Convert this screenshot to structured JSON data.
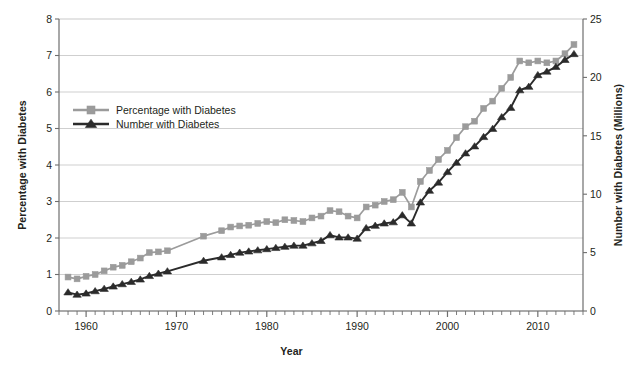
{
  "chart_data": {
    "type": "line",
    "title": "",
    "subtitle": "",
    "xlabel": "Year",
    "ylabel": "Percentage with Diabetes",
    "ylabel_right": "Number with Diabetes (Millions)",
    "grid": true,
    "legend_position": "upper-left-inside",
    "xlim": [
      1957,
      2015
    ],
    "ylim": [
      0,
      8
    ],
    "ylim_right": [
      0,
      25
    ],
    "xticks": [
      1960,
      1970,
      1980,
      1990,
      2000,
      2010
    ],
    "xtick_labels": [
      "1960",
      "1970",
      "1980",
      "1990",
      "2000",
      "2010"
    ],
    "xminor_tick_step": 1,
    "yticks": [
      0,
      1,
      2,
      3,
      4,
      5,
      6,
      7,
      8
    ],
    "ytick_labels": [
      "0",
      "1",
      "2",
      "3",
      "4",
      "5",
      "6",
      "7",
      "8"
    ],
    "yticks_right": [
      0,
      5,
      10,
      15,
      20,
      25
    ],
    "ytick_labels_right": [
      "0",
      "5",
      "10",
      "15",
      "20",
      "25"
    ],
    "x": [
      1958,
      1959,
      1960,
      1961,
      1962,
      1963,
      1964,
      1965,
      1966,
      1967,
      1968,
      1969,
      1973,
      1975,
      1976,
      1977,
      1978,
      1979,
      1980,
      1981,
      1982,
      1983,
      1984,
      1985,
      1986,
      1987,
      1988,
      1989,
      1990,
      1991,
      1992,
      1993,
      1994,
      1995,
      1996,
      1997,
      1998,
      1999,
      2000,
      2001,
      2002,
      2003,
      2004,
      2005,
      2006,
      2007,
      2008,
      2009,
      2010,
      2011,
      2012,
      2013,
      2014
    ],
    "series": [
      {
        "name": "Percentage with Diabetes",
        "axis": "left",
        "color": "#9b9b9b",
        "marker": "square",
        "values": [
          0.93,
          0.88,
          0.95,
          1.0,
          1.1,
          1.2,
          1.25,
          1.35,
          1.45,
          1.6,
          1.62,
          1.65,
          2.05,
          2.2,
          2.3,
          2.33,
          2.35,
          2.4,
          2.45,
          2.42,
          2.5,
          2.48,
          2.45,
          2.55,
          2.6,
          2.75,
          2.72,
          2.6,
          2.55,
          2.85,
          2.9,
          3.0,
          3.05,
          3.25,
          2.85,
          3.55,
          3.85,
          4.15,
          4.4,
          4.75,
          5.05,
          5.2,
          5.55,
          5.75,
          6.1,
          6.4,
          6.85,
          6.8,
          6.85,
          6.8,
          6.85,
          7.05,
          7.3
        ]
      },
      {
        "name": "Number with Diabetes",
        "axis": "right",
        "color": "#2b2b2b",
        "marker": "triangle",
        "values": [
          1.6,
          1.4,
          1.5,
          1.7,
          1.9,
          2.1,
          2.3,
          2.5,
          2.7,
          3.0,
          3.2,
          3.4,
          4.3,
          4.6,
          4.8,
          5.0,
          5.1,
          5.2,
          5.3,
          5.4,
          5.5,
          5.6,
          5.6,
          5.8,
          6.0,
          6.5,
          6.3,
          6.3,
          6.2,
          7.1,
          7.3,
          7.5,
          7.6,
          8.2,
          7.5,
          9.3,
          10.3,
          11.0,
          11.9,
          12.7,
          13.5,
          14.1,
          14.9,
          15.6,
          16.6,
          17.4,
          18.9,
          19.2,
          20.2,
          20.5,
          20.9,
          21.5,
          22.0
        ]
      }
    ],
    "legend": [
      {
        "label": "Percentage with Diabetes",
        "color": "#9b9b9b",
        "marker": "square"
      },
      {
        "label": "Number with Diabetes",
        "color": "#2b2b2b",
        "marker": "triangle"
      }
    ]
  },
  "colors": {
    "series_percentage": "#9b9b9b",
    "series_number": "#2b2b2b",
    "grid": "#c9c9c9",
    "axis": "#6e6e6e",
    "text": "#231f20",
    "background": "#ffffff"
  }
}
